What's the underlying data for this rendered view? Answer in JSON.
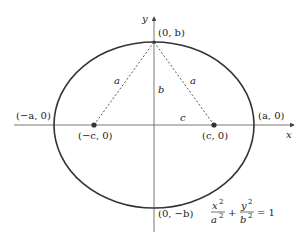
{
  "diagram": {
    "equation": {
      "num1": "x",
      "sup1": "2",
      "den1": "a",
      "dsup1": "2",
      "plus": "+",
      "num2": "y",
      "sup2": "2",
      "den2": "b",
      "dsup2": "2",
      "rhs": "= 1"
    },
    "axes": {
      "x_label": "x",
      "y_label": "y"
    },
    "points": {
      "top_vertex": "(0, b)",
      "bottom_vertex": "(0, −b)",
      "left_vertex": "(−a, 0)",
      "right_vertex": "(a, 0)",
      "left_focus": "(−c, 0)",
      "right_focus": "(c, 0)"
    },
    "segments": {
      "left_dashed": "a",
      "right_dashed": "a",
      "vertical": "b",
      "horizontal": "c"
    },
    "colors": {
      "curve": "#333333",
      "axes": "#444444",
      "text": "#222222"
    }
  }
}
